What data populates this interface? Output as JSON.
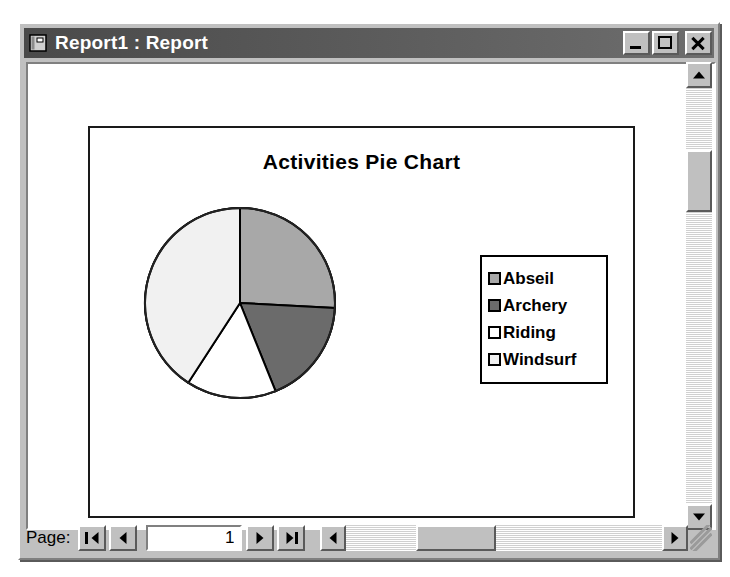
{
  "window": {
    "title": "Report1 : Report",
    "icon": "report-document-icon",
    "minimize_label": "Minimize",
    "maximize_label": "Restore",
    "close_label": "Close"
  },
  "report": {
    "title": "Activities Pie Chart"
  },
  "statusbar": {
    "page_label": "Page:",
    "first_label": "First page",
    "prev_label": "Previous page",
    "next_label": "Next page",
    "last_label": "Last page",
    "page_value": "1"
  },
  "chart_data": {
    "type": "pie",
    "title": "Activities Pie Chart",
    "categories": [
      "Abseil",
      "Archery",
      "Riding",
      "Windsurf"
    ],
    "values": [
      26,
      18,
      15,
      41
    ],
    "angles_deg": [
      93,
      65,
      55,
      147
    ],
    "colors": [
      "#a8a8a8",
      "#6b6b6b",
      "#ffffff",
      "#f1f1f1"
    ],
    "start_angle_deg": 0,
    "direction": "clockwise",
    "legend": {
      "position": "right",
      "entries": [
        {
          "label": "Abseil",
          "color": "#a8a8a8"
        },
        {
          "label": "Archery",
          "color": "#6b6b6b"
        },
        {
          "label": "Riding",
          "color": "#ffffff"
        },
        {
          "label": "Windsurf",
          "color": "#f1f1f1"
        }
      ]
    },
    "slice_border_color": "#000000",
    "grid": false,
    "xlabel": "",
    "ylabel": ""
  }
}
